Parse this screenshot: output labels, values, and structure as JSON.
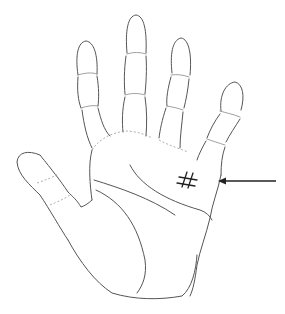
{
  "diagram": {
    "hand": "left-palm-facing-viewer",
    "marker": {
      "type": "grid-cross-mark",
      "location": "mount-below-little-finger"
    },
    "arrow": {
      "direction": "pointing-left",
      "target": "grid-cross-mark"
    },
    "colors": {
      "background": "#ffffff",
      "outline": "#555555",
      "mark": "#222222"
    }
  }
}
